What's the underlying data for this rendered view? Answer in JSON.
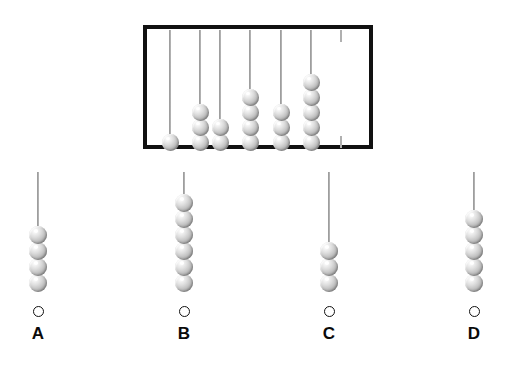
{
  "page": {
    "background_color": "#ffffff",
    "type": "abacus-multiple-choice-question",
    "width": 514,
    "height": 372
  },
  "question_box": {
    "name": "abacus-frame",
    "border_color": "#111111",
    "border_width": 4,
    "x": 143,
    "y": 25,
    "width": 230,
    "height": 124,
    "rod_count": 7,
    "bead_color": "#c8c8c8",
    "rods": [
      {
        "index": 1,
        "label": "rod-1",
        "bead_count": 1,
        "x": 170
      },
      {
        "index": 2,
        "label": "rod-2",
        "bead_count": 3,
        "x": 200
      },
      {
        "index": 3,
        "label": "rod-3",
        "bead_count": 2,
        "x": 220
      },
      {
        "index": 4,
        "label": "rod-4",
        "bead_count": 4,
        "x": 250
      },
      {
        "index": 5,
        "label": "rod-5",
        "bead_count": 3,
        "x": 281
      },
      {
        "index": 6,
        "label": "rod-6",
        "bead_count": 5,
        "x": 311
      },
      {
        "index": 7,
        "label": "rod-7-empty",
        "bead_count": 0,
        "x": 341
      }
    ],
    "total_beads": 18
  },
  "choices": [
    {
      "id": "A",
      "label": "A",
      "name": "choice-a",
      "bead_count": 4,
      "rod_x": 38,
      "selected": false,
      "radio_state": "unchecked"
    },
    {
      "id": "B",
      "label": "B",
      "name": "choice-b",
      "bead_count": 6,
      "rod_x": 184,
      "selected": false,
      "radio_state": "unchecked"
    },
    {
      "id": "C",
      "label": "C",
      "name": "choice-c",
      "bead_count": 3,
      "rod_x": 329,
      "selected": false,
      "radio_state": "unchecked"
    },
    {
      "id": "D",
      "label": "D",
      "name": "choice-d",
      "bead_count": 5,
      "rod_x": 474,
      "selected": false,
      "radio_state": "unchecked"
    }
  ],
  "chart_data": {
    "type": "bar",
    "categories": [
      "1",
      "2",
      "3",
      "4",
      "5",
      "6",
      "7"
    ],
    "values": [
      1,
      3,
      2,
      4,
      3,
      5,
      0
    ],
    "xlabel": "Rod",
    "ylabel": "Beads",
    "ylim": [
      0,
      6
    ],
    "choice_categories": [
      "A",
      "B",
      "C",
      "D"
    ],
    "choice_values": [
      4,
      6,
      3,
      5
    ]
  }
}
